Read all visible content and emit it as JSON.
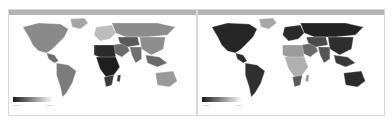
{
  "maps": [
    {
      "id": "left",
      "legend": {
        "low_label": "Higher",
        "high_label": "Lower",
        "gradient": [
          "#1a1a1a",
          "#ffffff"
        ]
      },
      "colors": {
        "north_america": "#8a8a8a",
        "greenland": "#a5a5a5",
        "central_america": "#6e6e6e",
        "south_america": "#7c7c7c",
        "europe": "#bdbdbd",
        "russia": "#8c8c8c",
        "middle_east": "#6a6a6a",
        "central_asia": "#5a5a5a",
        "south_asia": "#707070",
        "east_asia": "#8e8e8e",
        "southeast_asia": "#6a6a6a",
        "africa_north": "#2a2a2a",
        "africa_sub": "#1e1e1e",
        "africa_south": "#3a3a3a",
        "australia": "#9a9a9a",
        "madagascar": "#3a3a3a"
      }
    },
    {
      "id": "right",
      "legend": {
        "low_label": "Higher",
        "high_label": "Lower",
        "gradient": [
          "#1a1a1a",
          "#ffffff"
        ]
      },
      "colors": {
        "north_america": "#262626",
        "greenland": "#a8a8a8",
        "central_america": "#2e2e2e",
        "south_america": "#2f2f2f",
        "europe": "#2a2a2a",
        "russia": "#232323",
        "middle_east": "#6a6a6a",
        "central_asia": "#4a4a4a",
        "south_asia": "#555555",
        "east_asia": "#2e2e2e",
        "southeast_asia": "#3a3a3a",
        "africa_north": "#9c9c9c",
        "africa_sub": "#b0b0b0",
        "africa_south": "#5a5a5a",
        "australia": "#2a2a2a",
        "madagascar": "#9c9c9c"
      }
    }
  ]
}
